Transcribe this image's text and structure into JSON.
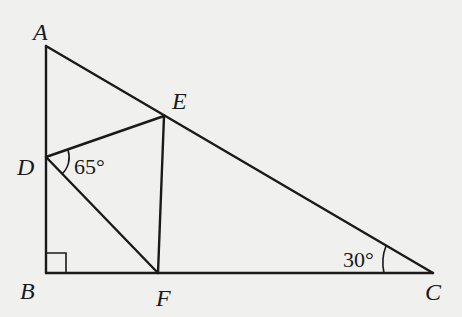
{
  "figure": {
    "type": "geometry",
    "points": {
      "A": {
        "label": "A",
        "x": 46,
        "y": 46
      },
      "B": {
        "label": "B",
        "x": 46,
        "y": 273
      },
      "C": {
        "label": "C",
        "x": 433,
        "y": 273
      },
      "D": {
        "label": "D",
        "x": 46,
        "y": 157
      },
      "E": {
        "label": "E",
        "x": 164,
        "y": 116
      },
      "F": {
        "label": "F",
        "x": 158,
        "y": 273
      }
    },
    "segments": [
      "AB",
      "BC",
      "AC",
      "DE",
      "DF",
      "EF"
    ],
    "angles": {
      "EDF": {
        "label": "65°"
      },
      "ACB": {
        "label": "30°"
      },
      "ABC": {
        "label": "right-angle"
      }
    }
  }
}
